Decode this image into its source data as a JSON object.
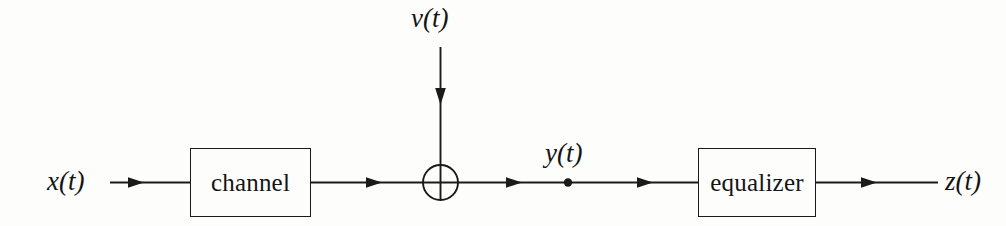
{
  "diagram": {
    "background_color": "#fdfdfb",
    "line_color": "#1a1a1a",
    "blocks": [
      {
        "id": "channel",
        "label": "channel"
      },
      {
        "id": "equalizer",
        "label": "equalizer"
      }
    ],
    "signals": {
      "input": "x(t)",
      "noise": "ν(t)",
      "middle": "y(t)",
      "output": "z(t)"
    },
    "junction": {
      "type": "summing-junction",
      "symbol": "⊕"
    },
    "node": {
      "type": "signal-tap-dot",
      "label": "y(t)"
    }
  }
}
